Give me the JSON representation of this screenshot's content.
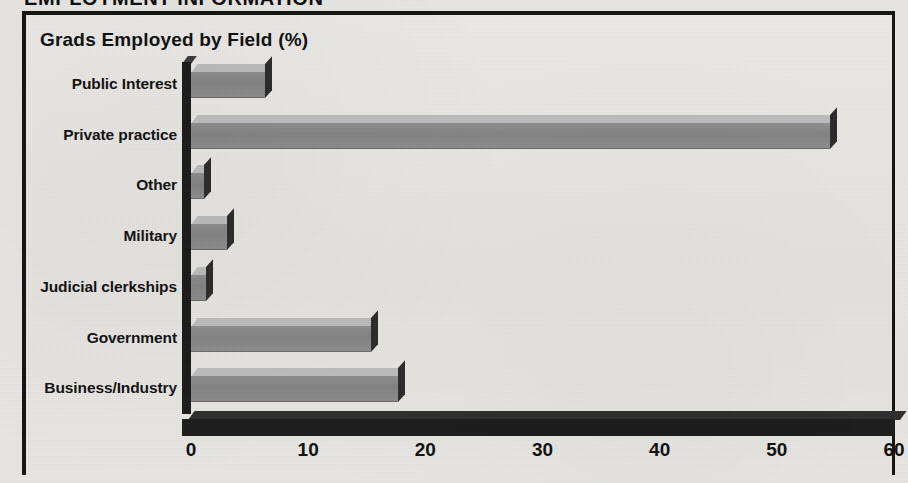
{
  "section_header": "EMPLOYMENT INFORMATION",
  "chart_data": {
    "type": "bar",
    "orientation": "horizontal",
    "style": "3d",
    "title": "Grads Employed by Field (%)",
    "xlabel": "",
    "ylabel": "",
    "xlim": [
      0,
      60
    ],
    "xticks": [
      "0",
      "10",
      "20",
      "30",
      "40",
      "50",
      "60"
    ],
    "xtick_values": [
      0,
      10,
      20,
      30,
      40,
      50,
      60
    ],
    "grid": false,
    "legend": null,
    "categories": [
      "Public Interest",
      "Private practice",
      "Other",
      "Military",
      "Judicial clerkships",
      "Government",
      "Business/Industry"
    ],
    "values": [
      6.3,
      54.5,
      1.1,
      3.1,
      1.3,
      15.4,
      17.7
    ],
    "bar_top_color": "#bdbdbd",
    "bar_front_color": "#8a8a8a",
    "bar_side_color": "#2b2b2b",
    "axis_color": "#1b1b1b",
    "background_color": "#e8e7e4"
  }
}
